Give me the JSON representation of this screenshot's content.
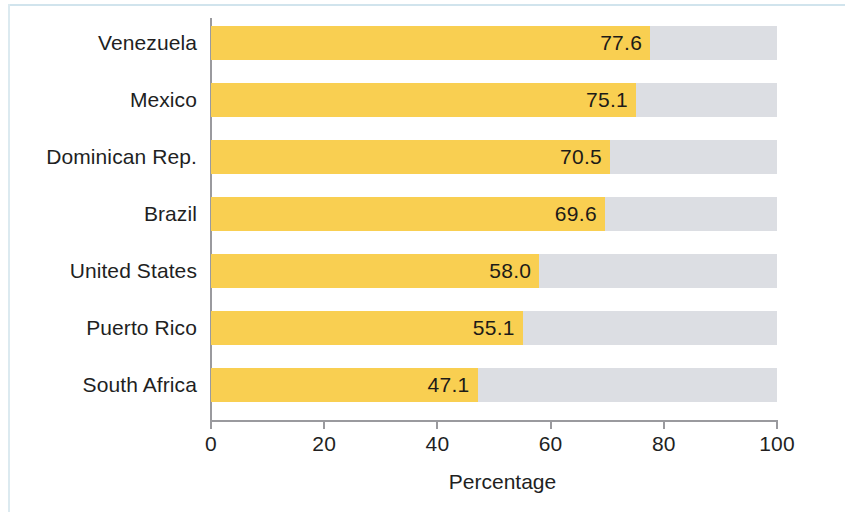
{
  "chart_data": {
    "type": "bar",
    "orientation": "horizontal",
    "title": "",
    "subtitle": "",
    "xlabel": "Percentage",
    "ylabel": "",
    "categories": [
      "Venezuela",
      "Mexico",
      "Dominican Rep.",
      "Brazil",
      "United States",
      "Puerto Rico",
      "South Africa"
    ],
    "values": [
      77.6,
      75.1,
      70.5,
      69.6,
      58.0,
      55.1,
      47.1
    ],
    "value_labels": [
      "77.6",
      "75.1",
      "70.5",
      "69.6",
      "58.0",
      "55.1",
      "47.1"
    ],
    "xlim": [
      0,
      100
    ],
    "xticks": [
      0,
      20,
      40,
      60,
      80,
      100
    ],
    "xtick_labels": [
      "0",
      "20",
      "40",
      "60",
      "80",
      "100"
    ],
    "grid": false,
    "legend": null,
    "series": [
      {
        "name": "Percentage",
        "values": [
          77.6,
          75.1,
          70.5,
          69.6,
          58.0,
          55.1,
          47.1
        ],
        "color": "#f9cf51"
      },
      {
        "name": "Remainder",
        "values": [
          22.4,
          24.9,
          29.5,
          30.4,
          42.0,
          44.9,
          52.9
        ],
        "color": "#dcdee3"
      }
    ],
    "colors": {
      "bar": "#f9cf51",
      "track": "#dcdee3",
      "axis": "#9a9a9e",
      "text": "#221f1f",
      "background": "#ffffff",
      "page_border": "#cfe3ec"
    }
  }
}
